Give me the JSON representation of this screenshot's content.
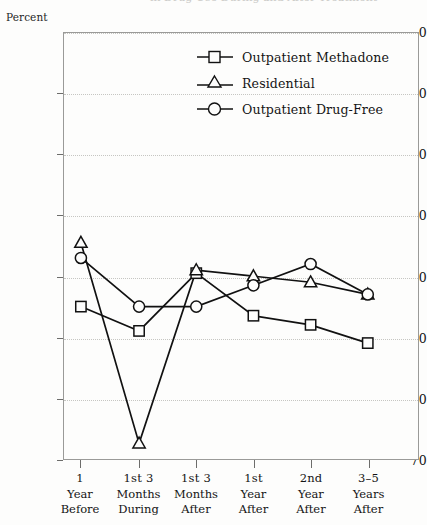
{
  "ghost_top_text": "in Drug Use During and After Treatment",
  "axis": {
    "y_caption": "Percent",
    "y_ticks": [
      "70",
      "60",
      "50",
      "40",
      "30",
      "20",
      "10",
      "0"
    ]
  },
  "legend": {
    "items": [
      {
        "marker": "square-marker-icon",
        "label": "Outpatient Methadone"
      },
      {
        "marker": "triangle-marker-icon",
        "label": "Residential"
      },
      {
        "marker": "circle-marker-icon",
        "label": "Outpatient Drug-Free"
      }
    ]
  },
  "chart_data": {
    "type": "line",
    "title": "",
    "subtitle": "",
    "xlabel": "",
    "ylabel": "Percent",
    "ylim": [
      0,
      70
    ],
    "yticks": [
      0,
      10,
      20,
      30,
      40,
      50,
      60,
      70
    ],
    "grid": true,
    "legend_position": "inside-top-right",
    "categories": [
      "1 Year Before",
      "1st 3 Months During",
      "1st 3 Months After",
      "1st Year After",
      "2nd Year After",
      "3-5 Years After"
    ],
    "category_lines": [
      [
        "1",
        "Year",
        "Before"
      ],
      [
        "1st 3",
        "Months",
        "During"
      ],
      [
        "1st 3",
        "Months",
        "After"
      ],
      [
        "1st",
        "Year",
        "After"
      ],
      [
        "2nd",
        "Year",
        "After"
      ],
      [
        "3–5",
        "Years",
        "After"
      ]
    ],
    "series": [
      {
        "name": "Outpatient Methadone",
        "marker": "square",
        "values": [
          25,
          21,
          30.5,
          23.5,
          22,
          19
        ]
      },
      {
        "name": "Residential",
        "marker": "triangle",
        "values": [
          35.5,
          2.5,
          31,
          30,
          29,
          27
        ]
      },
      {
        "name": "Outpatient Drug-Free",
        "marker": "circle",
        "values": [
          33,
          25,
          25,
          28.5,
          32,
          27
        ]
      }
    ]
  },
  "colors": {
    "line": "#111111",
    "marker_fill": "#fdfdfc",
    "grid": "#c6c6c2",
    "frame": "#9a9a98",
    "background": "#fdfdfc"
  }
}
